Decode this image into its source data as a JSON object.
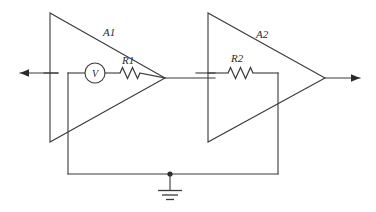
{
  "diagram": {
    "stroke_color": "#3a3a3a",
    "background_color": "#ffffff",
    "labels": {
      "amp1": "A1",
      "amp2": "A2",
      "resistor1": "R1",
      "resistor2": "R2",
      "voltmeter": "V"
    },
    "components": [
      {
        "name": "amplifier-a1",
        "type": "triangle",
        "label": "A1"
      },
      {
        "name": "amplifier-a2",
        "type": "triangle",
        "label": "A2"
      },
      {
        "name": "resistor-r1",
        "type": "resistor",
        "label": "R1"
      },
      {
        "name": "resistor-r2",
        "type": "resistor",
        "label": "R2"
      },
      {
        "name": "voltmeter-v",
        "type": "meter",
        "label": "V"
      },
      {
        "name": "ground-symbol",
        "type": "ground",
        "label": ""
      },
      {
        "name": "input-arrow",
        "type": "arrow",
        "label": ""
      },
      {
        "name": "output-arrow",
        "type": "arrow",
        "label": ""
      }
    ]
  }
}
